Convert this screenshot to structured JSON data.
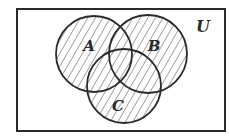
{
  "diagram": {
    "type": "venn",
    "shaded_region": "A ∪ B ∪ C",
    "universe": {
      "label": "U",
      "rect": {
        "x": 17,
        "y": 9,
        "width": 208,
        "height": 122
      },
      "label_pos": {
        "x": 203,
        "y": 27
      }
    },
    "sets": [
      {
        "label": "A",
        "cx": 94,
        "cy": 54,
        "r": 38,
        "label_pos": {
          "x": 89,
          "y": 46
        }
      },
      {
        "label": "B",
        "cx": 148,
        "cy": 54,
        "r": 39,
        "label_pos": {
          "x": 154,
          "y": 46
        }
      },
      {
        "label": "C",
        "cx": 124,
        "cy": 86,
        "r": 37,
        "label_pos": {
          "x": 118,
          "y": 106
        }
      }
    ],
    "colors": {
      "stroke": "#2a2a2a",
      "hatch": "#3a3a3a",
      "background": "#ffffff"
    }
  }
}
